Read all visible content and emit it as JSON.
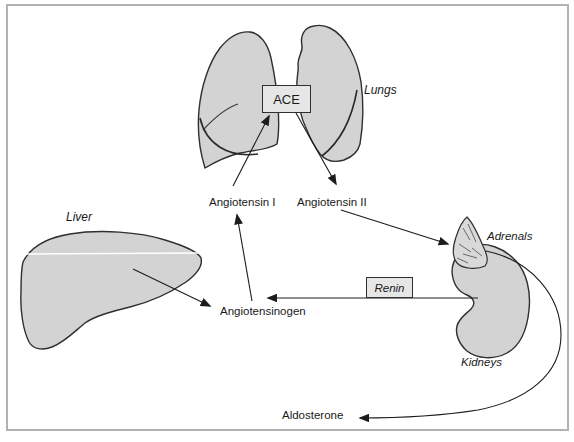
{
  "canvas": {
    "width": 574,
    "height": 442,
    "background": "#ffffff",
    "frame_border_color": "#b2b2b2"
  },
  "colors": {
    "organ_fill": "#d3d3d3",
    "organ_outline": "#2f2f2f",
    "arrow": "#1c1c1c",
    "box_fill": "#e6e6e6",
    "box_border": "#2f2f2f",
    "text": "#1a1a1a"
  },
  "boxes": {
    "ace": {
      "label": "ACE"
    },
    "renin": {
      "label": "Renin"
    }
  },
  "organs": {
    "lungs": {
      "label": "Lungs"
    },
    "liver": {
      "label": "Liver"
    },
    "adrenals": {
      "label": "Adrenals"
    },
    "kidneys": {
      "label": "Kidneys"
    }
  },
  "substances": {
    "angiotensin_i": {
      "label": "Angiotensin I"
    },
    "angiotensin_ii": {
      "label": "Angiotensin II"
    },
    "angiotensinogen": {
      "label": "Angiotensinogen"
    },
    "aldosterone": {
      "label": "Aldosterone"
    }
  },
  "flows": [
    {
      "from": "Liver",
      "to": "Angiotensinogen"
    },
    {
      "from": "Kidneys (Renin)",
      "to": "Angiotensinogen"
    },
    {
      "from": "Angiotensinogen",
      "to": "Angiotensin I"
    },
    {
      "from": "Angiotensin I",
      "to": "ACE"
    },
    {
      "from": "ACE",
      "to": "Angiotensin II"
    },
    {
      "from": "Angiotensin II",
      "to": "Adrenals"
    },
    {
      "from": "Adrenals",
      "to": "Aldosterone"
    }
  ]
}
